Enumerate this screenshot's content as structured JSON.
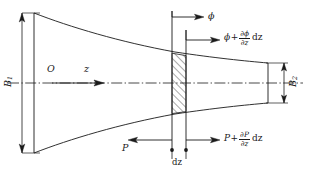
{
  "figure": {
    "kind": "exponential-horn-cross-section-diagram",
    "background_color": "#ffffff",
    "line_color": "#1a1a1a",
    "axis": {
      "origin_label": "O",
      "axis_label": "z"
    },
    "dimensions": {
      "mouth": {
        "symbol": "B",
        "subscript": "1"
      },
      "throat": {
        "symbol": "B",
        "subscript": "2"
      },
      "slice_thickness": {
        "text": "dz"
      }
    },
    "flux_terms": {
      "inflow": {
        "symbol": "ϕ"
      },
      "outflow": {
        "symbol": "ϕ",
        "plus": "+",
        "numerator_partial": "∂",
        "numerator_var": "ϕ",
        "denominator_partial": "∂",
        "denominator_var": "z",
        "differential": "dz"
      }
    },
    "pressure_terms": {
      "inflow": {
        "symbol": "P"
      },
      "outflow": {
        "symbol": "P",
        "plus": "+",
        "numerator_partial": "∂",
        "numerator_var": "P",
        "denominator_partial": "∂",
        "denominator_var": "z",
        "differential": "dz"
      }
    }
  }
}
